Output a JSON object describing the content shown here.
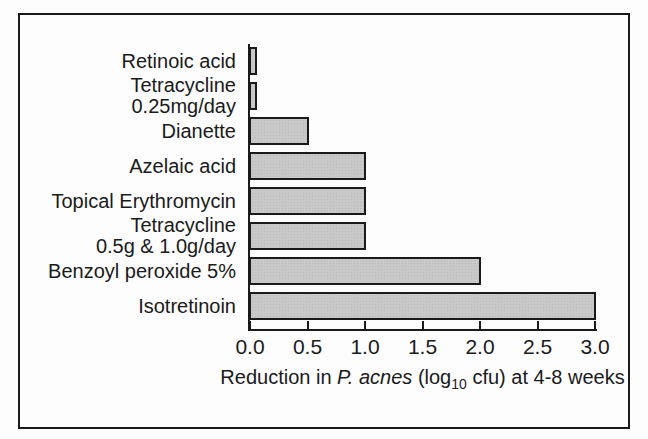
{
  "chart_data": {
    "type": "bar",
    "orientation": "horizontal",
    "title": "",
    "xlabel": "Reduction in P. acnes (log10 cfu) at 4-8 weeks",
    "xlabel_parts": [
      {
        "text": "Reduction in ",
        "style": "normal"
      },
      {
        "text": "P. acnes",
        "style": "italic"
      },
      {
        "text": " (log",
        "style": "normal"
      },
      {
        "text": "10",
        "style": "sub"
      },
      {
        "text": " cfu) at 4-8 weeks",
        "style": "normal"
      }
    ],
    "categories": [
      "Retinoic acid",
      "Tetracycline 0.25mg/day",
      "Dianette",
      "Azelaic acid",
      "Topical Erythromycin",
      "Tetracycline 0.5g & 1.0g/day",
      "Benzoyl peroxide 5%",
      "Isotretinoin"
    ],
    "category_lines": [
      [
        "Retinoic acid"
      ],
      [
        "Tetracycline",
        "0.25mg/day"
      ],
      [
        "Dianette"
      ],
      [
        "Azelaic acid"
      ],
      [
        "Topical Erythromycin"
      ],
      [
        "Tetracycline",
        "0.5g & 1.0g/day"
      ],
      [
        "Benzoyl peroxide 5%"
      ],
      [
        "Isotretinoin"
      ]
    ],
    "values": [
      0.05,
      0.05,
      0.5,
      1.0,
      1.0,
      1.0,
      2.0,
      3.0
    ],
    "xlim": [
      0.0,
      3.0
    ],
    "xtick_labels": [
      "0.0",
      "0.5",
      "1.0",
      "1.5",
      "2.0",
      "2.5",
      "3.0"
    ],
    "xtick_values": [
      0.0,
      0.5,
      1.0,
      1.5,
      2.0,
      2.5,
      3.0
    ],
    "grid": false,
    "legend": null,
    "colors": {
      "bar_fill": "#c9c9c9",
      "bar_border": "#1a1a1a",
      "axis": "#1a1a1a",
      "text": "#1a1a1a",
      "frame_border": "#1a1a1a",
      "background": "#fdfdfd"
    }
  }
}
